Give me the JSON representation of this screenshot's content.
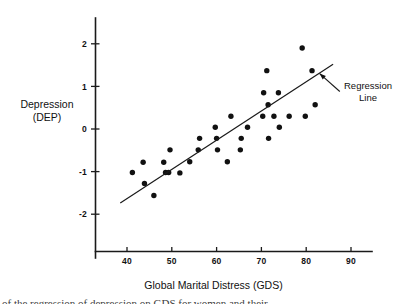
{
  "figure": {
    "y_axis_title_line1": "Depression",
    "y_axis_title_line2": "(DEP)",
    "x_axis_title": "Global Marital Distress (GDS)",
    "annotation_line1": "Regression",
    "annotation_line2": "Line",
    "caption_fragment": "of the regression of depression on GDS for women and their"
  },
  "colors": {
    "ink": "#111111",
    "axis": "#1a1a1a",
    "background": "#ffffff"
  },
  "chart_data": {
    "type": "scatter",
    "title": "",
    "xlabel": "Global Marital Distress (GDS)",
    "ylabel": "Depression (DEP)",
    "xlim": [
      34,
      95
    ],
    "ylim": [
      -2.6,
      2.45
    ],
    "xticks": [
      40,
      50,
      60,
      70,
      80,
      90
    ],
    "xtick_labels": [
      "40",
      "50",
      "60",
      "70",
      "80",
      "90"
    ],
    "yticks": [
      -2,
      -1,
      0,
      1,
      2
    ],
    "ytick_labels": [
      "-2",
      "-1",
      "0",
      "1",
      "2"
    ],
    "grid": false,
    "legend": "none",
    "marker": "filled-circle",
    "points": [
      {
        "x": 41.2,
        "y": -1.02
      },
      {
        "x": 43.6,
        "y": -0.78
      },
      {
        "x": 43.9,
        "y": -1.28
      },
      {
        "x": 46.0,
        "y": -1.56
      },
      {
        "x": 48.2,
        "y": -0.78
      },
      {
        "x": 48.6,
        "y": -1.02
      },
      {
        "x": 49.3,
        "y": -1.02
      },
      {
        "x": 49.6,
        "y": -0.49
      },
      {
        "x": 51.8,
        "y": -1.03
      },
      {
        "x": 54.0,
        "y": -0.77
      },
      {
        "x": 55.9,
        "y": -0.49
      },
      {
        "x": 56.2,
        "y": -0.22
      },
      {
        "x": 59.7,
        "y": 0.04
      },
      {
        "x": 60.0,
        "y": -0.22
      },
      {
        "x": 60.2,
        "y": -0.49
      },
      {
        "x": 62.4,
        "y": -0.77
      },
      {
        "x": 63.2,
        "y": 0.3
      },
      {
        "x": 65.3,
        "y": -0.49
      },
      {
        "x": 65.5,
        "y": -0.22
      },
      {
        "x": 66.9,
        "y": 0.04
      },
      {
        "x": 70.3,
        "y": 0.3
      },
      {
        "x": 70.5,
        "y": 0.85
      },
      {
        "x": 71.2,
        "y": 1.37
      },
      {
        "x": 71.5,
        "y": 0.57
      },
      {
        "x": 71.6,
        "y": -0.22
      },
      {
        "x": 72.8,
        "y": 0.3
      },
      {
        "x": 73.8,
        "y": 0.85
      },
      {
        "x": 74.0,
        "y": 0.04
      },
      {
        "x": 76.2,
        "y": 0.3
      },
      {
        "x": 79.1,
        "y": 1.9
      },
      {
        "x": 79.8,
        "y": 0.3
      },
      {
        "x": 81.3,
        "y": 1.37
      },
      {
        "x": 82.0,
        "y": 0.57
      }
    ],
    "regression_line": {
      "label": "Regression Line",
      "x_start": 38.5,
      "y_start": -1.74,
      "x_end": 86.0,
      "y_end": 1.52,
      "slope": 0.0686,
      "intercept": -4.38
    },
    "annotation_arrow": {
      "text": "Regression Line",
      "tip_x": 83.0,
      "tip_y": 1.3,
      "tail_x": 87.5,
      "tail_y": 0.88
    }
  }
}
